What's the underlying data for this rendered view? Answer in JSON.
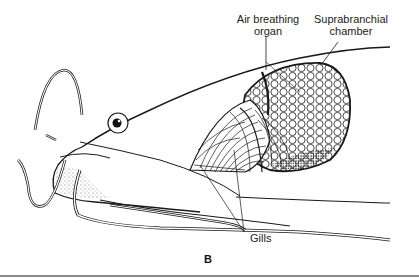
{
  "figure": {
    "panel_label": "B",
    "labels": {
      "air_breathing_organ_line1": "Air breathing",
      "air_breathing_organ_line2": "organ",
      "suprabranchial_line1": "Suprabranchial",
      "suprabranchial_line2": "chamber",
      "gills": "Gills"
    },
    "colors": {
      "ink": "#1a1a1a",
      "paper": "#ffffff",
      "rule": "#8a8a8a"
    }
  }
}
